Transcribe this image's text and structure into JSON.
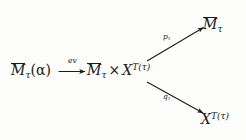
{
  "diagram": {
    "kind": "commutative-diagram",
    "ink_color": "#1a1a1a",
    "background_color": "#fdfdfc",
    "nodes": [
      {
        "id": "source",
        "name": "moduli-space-of-alpha",
        "latex": "\\overline{M}_\\tau(\\alpha)",
        "plain": "M̄_τ(α)",
        "base": "M",
        "overline": true,
        "subscript": "τ",
        "argument": "(α)",
        "position": "left"
      },
      {
        "id": "product",
        "name": "product-space",
        "latex": "\\overline{M}_\\tau \\times X^{T(\\tau)}",
        "plain": "M̄_τ × X^{T(τ)}",
        "left_factor_base": "M",
        "left_factor_overline": true,
        "left_factor_subscript": "τ",
        "operator": "×",
        "right_factor_base": "X",
        "right_factor_superscript": "T(τ)",
        "position": "center"
      },
      {
        "id": "target-top",
        "name": "moduli-space",
        "latex": "\\overline{M}_\\tau",
        "plain": "M̄_τ",
        "base": "M",
        "overline": true,
        "subscript": "τ",
        "position": "top-right"
      },
      {
        "id": "target-bottom",
        "name": "configuration-space",
        "latex": "X^{T(\\tau)}",
        "plain": "X^{T(τ)}",
        "base": "X",
        "superscript": "T(τ)",
        "position": "bottom-right"
      }
    ],
    "arrows": [
      {
        "id": "ev",
        "name": "evaluation-map",
        "from": "source",
        "to": "product",
        "label": "ev",
        "label_latex": "ev",
        "direction": "right",
        "style": "solid"
      },
      {
        "id": "p",
        "name": "first-projection",
        "from": "product",
        "to": "target-top",
        "label": "p",
        "label_subscript": "τ",
        "label_latex": "p_\\tau",
        "label_plain": "p_τ",
        "direction": "up-right",
        "style": "solid"
      },
      {
        "id": "q",
        "name": "second-projection",
        "from": "product",
        "to": "target-bottom",
        "label": "q",
        "label_subscript": "τ",
        "label_latex": "q_\\tau",
        "label_plain": "q_τ",
        "direction": "down-right",
        "style": "solid"
      }
    ]
  }
}
